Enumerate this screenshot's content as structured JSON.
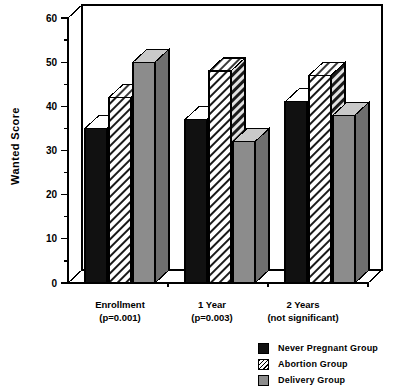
{
  "chart_data": {
    "type": "bar",
    "title": "",
    "xlabel": "",
    "ylabel": "Wanted Score",
    "ylim": [
      0,
      60
    ],
    "yticks": [
      0,
      10,
      20,
      30,
      40,
      50,
      60
    ],
    "minor_tick_interval": 5,
    "grid": false,
    "legend_position": "bottom-right",
    "style": "3d-bar",
    "categories": [
      "Enrollment",
      "1 Year",
      "2 Years"
    ],
    "category_annotations": [
      "(p=0.001)",
      "(p=0.003)",
      "(not significant)"
    ],
    "series": [
      {
        "name": "Never Pregnant Group",
        "color": "#111111",
        "fill": "solid-black",
        "values": [
          35,
          37,
          41
        ]
      },
      {
        "name": "Abortion Group",
        "color": "#ffffff",
        "fill": "diagonal-hatch",
        "values": [
          42,
          48,
          47
        ]
      },
      {
        "name": "Delivery Group",
        "color": "#8c8c8c",
        "fill": "solid-gray",
        "values": [
          50,
          32,
          38
        ]
      }
    ]
  },
  "axis": {
    "y_title": "Wanted Score",
    "tick_labels": [
      "60",
      "50",
      "40",
      "30",
      "20",
      "10",
      "0"
    ]
  },
  "xlabels": [
    {
      "line1": "Enrollment",
      "line2": "(p=0.001)"
    },
    {
      "line1": "1 Year",
      "line2": "(p=0.003)"
    },
    {
      "line1": "2 Years",
      "line2": "(not significant)"
    }
  ],
  "legend": {
    "items": [
      {
        "label": "Never Pregnant Group",
        "swatch": "black-swatch-icon"
      },
      {
        "label": "Abortion Group",
        "swatch": "hatched-swatch-icon"
      },
      {
        "label": "Delivery Group",
        "swatch": "gray-swatch-icon"
      }
    ]
  }
}
